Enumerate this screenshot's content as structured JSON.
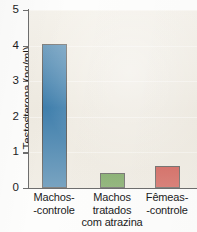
{
  "chart_data": {
    "type": "bar",
    "title": "",
    "xlabel": "",
    "ylabel": "Testosterona (ng/ml)",
    "ylim": [
      0,
      5
    ],
    "yticks": [
      0,
      1,
      2,
      3,
      4,
      5
    ],
    "ytick_labels": [
      "0",
      "1",
      "2",
      "3",
      "4",
      "5"
    ],
    "grid": true,
    "legend": "none",
    "categories": [
      "Machos-\n-controle",
      "Machos\ntratados\ncom atrazina",
      "Fêmeas-\n-controle"
    ],
    "category_lines": [
      [
        "Machos-",
        "-controle"
      ],
      [
        "Machos",
        "tratados",
        "com atrazina"
      ],
      [
        "Fêmeas-",
        "-controle"
      ]
    ],
    "values": [
      4.05,
      0.43,
      0.63
    ],
    "bar_colors": [
      "#1565a0",
      "#4a8b2c",
      "#c62a22"
    ],
    "bar_edge_color": "#2b2b2b",
    "plot_background": "#efebe2",
    "figure_background": "#fdfdfc",
    "axis_color": "#6e6e6e"
  },
  "axis": {
    "y_title": "Testosterona (ng/ml)"
  }
}
